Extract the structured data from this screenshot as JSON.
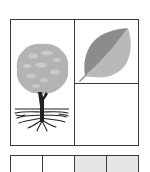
{
  "figure": {
    "frame_color": "#3a3a3a",
    "background": "#ffffff",
    "panels": [
      {
        "id": "tree",
        "icon": "tree-with-roots-icon",
        "crown_color": "#b3b3b3",
        "crown_highlight": "#c9c9c9",
        "trunk_color": "#222222"
      },
      {
        "id": "leaf",
        "icon": "leaf-icon",
        "dark_half_color": "#8c8c8c",
        "light_half_color": "#b9b9b9"
      },
      {
        "id": "empty",
        "icon": null
      }
    ],
    "strip": {
      "cells": [
        {
          "fill": "#ffffff"
        },
        {
          "fill": "#ffffff"
        },
        {
          "fill": "#e6e6e6"
        },
        {
          "fill": "#e6e6e6"
        }
      ]
    }
  }
}
